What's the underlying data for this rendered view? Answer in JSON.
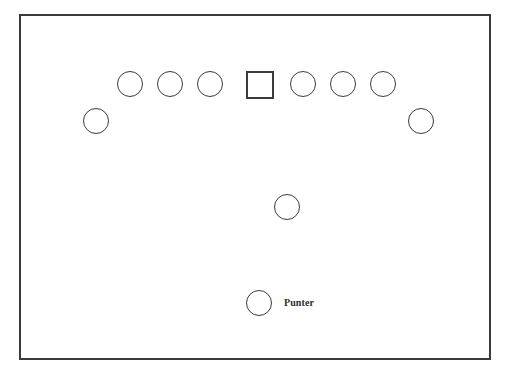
{
  "diagram": {
    "type": "football-formation-diagram",
    "background_color": "#ffffff",
    "stroke_color": "#3b3b3b",
    "border": {
      "x": 19,
      "y": 14,
      "width": 472,
      "height": 346
    },
    "players": [
      {
        "id": "left-gunner",
        "name": "left-gunner",
        "shape": "circle",
        "x": 83,
        "y": 108,
        "size": 26,
        "label": ""
      },
      {
        "id": "left-end",
        "name": "left-end",
        "shape": "circle",
        "x": 117,
        "y": 71,
        "size": 26,
        "label": ""
      },
      {
        "id": "left-tackle",
        "name": "left-tackle",
        "shape": "circle",
        "x": 157,
        "y": 71,
        "size": 26,
        "label": ""
      },
      {
        "id": "left-guard",
        "name": "left-guard",
        "shape": "circle",
        "x": 197,
        "y": 71,
        "size": 26,
        "label": ""
      },
      {
        "id": "center-snapper",
        "name": "center-snapper",
        "shape": "square",
        "x": 246,
        "y": 71,
        "size": 28,
        "label": ""
      },
      {
        "id": "right-guard",
        "name": "right-guard",
        "shape": "circle",
        "x": 290,
        "y": 71,
        "size": 26,
        "label": ""
      },
      {
        "id": "right-tackle",
        "name": "right-tackle",
        "shape": "circle",
        "x": 330,
        "y": 71,
        "size": 26,
        "label": ""
      },
      {
        "id": "right-end",
        "name": "right-end",
        "shape": "circle",
        "x": 370,
        "y": 71,
        "size": 26,
        "label": ""
      },
      {
        "id": "right-gunner",
        "name": "right-gunner",
        "shape": "circle",
        "x": 408,
        "y": 108,
        "size": 26,
        "label": ""
      },
      {
        "id": "personal-protector",
        "name": "personal-protector",
        "shape": "circle",
        "x": 274,
        "y": 194,
        "size": 26,
        "label": ""
      },
      {
        "id": "punter",
        "name": "punter",
        "shape": "circle",
        "x": 246,
        "y": 290,
        "size": 26,
        "label": "Punter"
      }
    ],
    "labels": [
      {
        "id": "punter-label",
        "name": "punter-label",
        "text": "Punter",
        "x": 284,
        "y": 298
      }
    ]
  }
}
